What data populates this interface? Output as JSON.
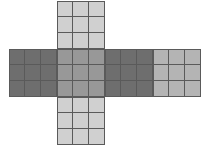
{
  "figure": {
    "name": "cube-net-cross",
    "background_color": "#ffffff",
    "grid_line_color": "#5a5a5a",
    "cell_size_px": 16,
    "face_size_px": 48,
    "grid_rows": 3,
    "grid_cols": 3,
    "colors": {
      "dark_gray": "#6e6e6e",
      "medium_gray": "#989898",
      "light_gray": "#d0d0d0",
      "mid_light_gray": "#b4b4b4"
    },
    "faces": [
      {
        "id": "face-top",
        "label": "top",
        "x": 57,
        "y": 1,
        "size": 48,
        "fill": "#d0d0d0"
      },
      {
        "id": "face-left",
        "label": "left",
        "x": 9,
        "y": 49,
        "size": 48,
        "fill": "#6e6e6e"
      },
      {
        "id": "face-center",
        "label": "center",
        "x": 57,
        "y": 49,
        "size": 48,
        "fill": "#989898"
      },
      {
        "id": "face-right",
        "label": "right",
        "x": 105,
        "y": 49,
        "size": 48,
        "fill": "#6e6e6e"
      },
      {
        "id": "face-far-right",
        "label": "far-right",
        "x": 153,
        "y": 49,
        "size": 48,
        "fill": "#b4b4b4"
      },
      {
        "id": "face-bottom",
        "label": "bottom",
        "x": 57,
        "y": 97,
        "size": 48,
        "fill": "#d0d0d0"
      }
    ]
  }
}
